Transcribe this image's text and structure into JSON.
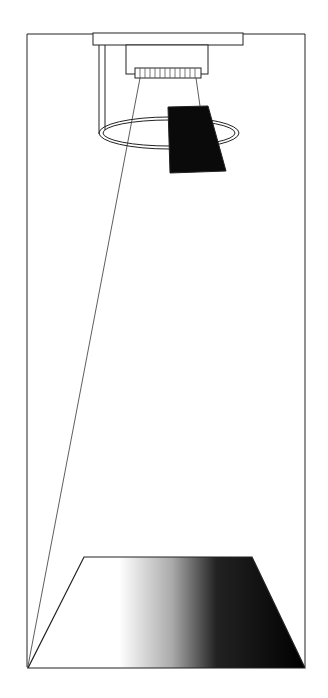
{
  "diagram": {
    "elements": [
      "frame",
      "mounting-plate",
      "camera-body",
      "lens-ring",
      "light-ring",
      "reflector-panel",
      "view-lines",
      "gradient-surface"
    ],
    "colors": {
      "line": "#222222",
      "panel": "#0a0a0a",
      "background": "#ffffff"
    }
  }
}
